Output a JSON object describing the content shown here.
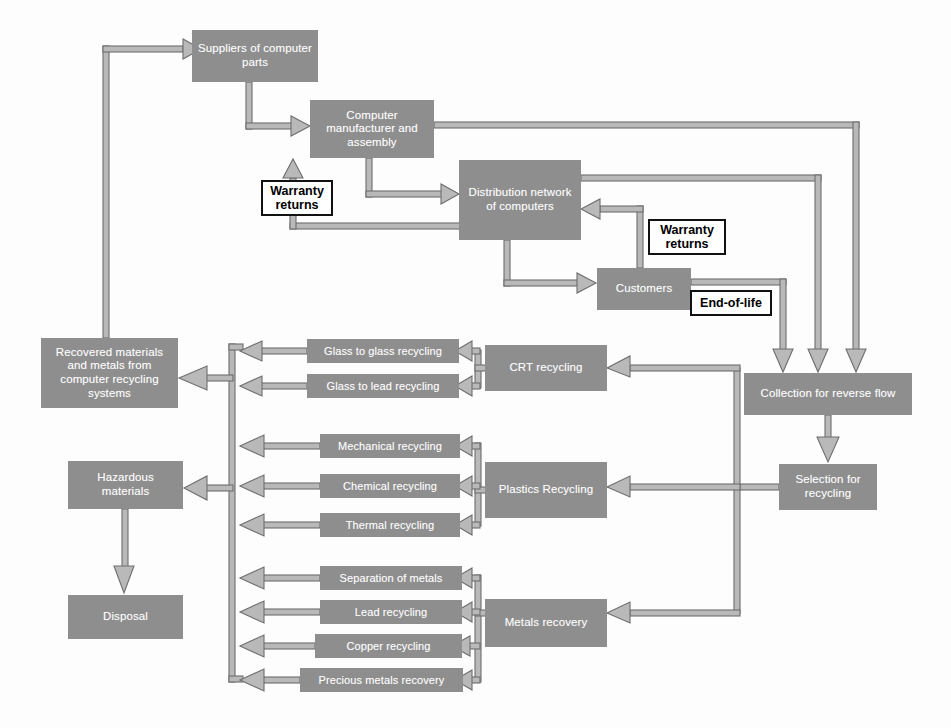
{
  "diagram": {
    "colors": {
      "node_fill": "#8e8e8e",
      "node_text": "#ffffff",
      "connector_fill": "#b3b3b3",
      "connector_stroke": "#6f6f6f",
      "label_border": "#111111",
      "background": "#fdfdfd"
    },
    "nodes": [
      {
        "id": "suppliers",
        "label": "Suppliers of computer parts",
        "x": 192,
        "y": 30,
        "w": 126,
        "h": 52
      },
      {
        "id": "manufacturer",
        "label": "Computer manufacturer and assembly",
        "x": 310,
        "y": 100,
        "w": 124,
        "h": 58
      },
      {
        "id": "distribution",
        "label": "Distribution network of computers",
        "x": 459,
        "y": 160,
        "w": 122,
        "h": 80
      },
      {
        "id": "customers",
        "label": "Customers",
        "x": 597,
        "y": 268,
        "w": 94,
        "h": 42
      },
      {
        "id": "collection",
        "label": "Collection for reverse flow",
        "x": 744,
        "y": 373,
        "w": 168,
        "h": 42
      },
      {
        "id": "selection",
        "label": "Selection for recycling",
        "x": 779,
        "y": 464,
        "w": 98,
        "h": 46
      },
      {
        "id": "crt",
        "label": "CRT recycling",
        "x": 485,
        "y": 345,
        "w": 122,
        "h": 46
      },
      {
        "id": "plastics",
        "label": "Plastics Recycling",
        "x": 485,
        "y": 462,
        "w": 122,
        "h": 56
      },
      {
        "id": "metals",
        "label": "Metals recovery",
        "x": 485,
        "y": 599,
        "w": 122,
        "h": 48
      },
      {
        "id": "glass_glass",
        "label": "Glass to glass recycling",
        "x": 307,
        "y": 339,
        "w": 152,
        "h": 24
      },
      {
        "id": "glass_lead",
        "label": "Glass to lead recycling",
        "x": 307,
        "y": 374,
        "w": 152,
        "h": 24
      },
      {
        "id": "mechanical",
        "label": "Mechanical recycling",
        "x": 320,
        "y": 434,
        "w": 140,
        "h": 24
      },
      {
        "id": "chemical",
        "label": "Chemical recycling",
        "x": 320,
        "y": 474,
        "w": 140,
        "h": 24
      },
      {
        "id": "thermal",
        "label": "Thermal recycling",
        "x": 320,
        "y": 513,
        "w": 140,
        "h": 24
      },
      {
        "id": "separation",
        "label": "Separation of metals",
        "x": 320,
        "y": 566,
        "w": 142,
        "h": 24
      },
      {
        "id": "lead_rec",
        "label": "Lead recycling",
        "x": 320,
        "y": 600,
        "w": 142,
        "h": 24
      },
      {
        "id": "copper_rec",
        "label": "Copper recycling",
        "x": 315,
        "y": 634,
        "w": 147,
        "h": 24
      },
      {
        "id": "precious",
        "label": "Precious metals recovery",
        "x": 300,
        "y": 668,
        "w": 163,
        "h": 24
      },
      {
        "id": "recovered",
        "label": "Recovered materials and metals from computer recycling systems",
        "x": 41,
        "y": 338,
        "w": 137,
        "h": 70
      },
      {
        "id": "hazardous",
        "label": "Hazardous materials",
        "x": 68,
        "y": 461,
        "w": 115,
        "h": 48
      },
      {
        "id": "disposal",
        "label": "Disposal",
        "x": 68,
        "y": 595,
        "w": 115,
        "h": 44
      }
    ],
    "label_boxes": [
      {
        "id": "warranty-returns-manufacturer",
        "label": "Warranty returns",
        "x": 261,
        "y": 180,
        "w": 72,
        "h": 36
      },
      {
        "id": "warranty-returns-distribution",
        "label": "Warranty returns",
        "x": 648,
        "y": 219,
        "w": 78,
        "h": 36
      },
      {
        "id": "end-of-life",
        "label": "End-of-life",
        "x": 690,
        "y": 290,
        "w": 82,
        "h": 26
      }
    ],
    "flows": [
      {
        "from": "recovered",
        "to": "suppliers",
        "label": "recovered materials returned to suppliers"
      },
      {
        "from": "suppliers",
        "to": "manufacturer",
        "label": "parts supply"
      },
      {
        "from": "manufacturer",
        "to": "distribution",
        "label": "finished computers"
      },
      {
        "from": "distribution",
        "to": "customers",
        "label": "distribution to customers"
      },
      {
        "from": "customers",
        "to": "distribution",
        "label": "warranty returns"
      },
      {
        "from": "distribution",
        "to": "manufacturer",
        "label": "warranty returns"
      },
      {
        "from": "customers",
        "to": "collection",
        "label": "end-of-life"
      },
      {
        "from": "distribution",
        "to": "collection",
        "label": "reverse flow"
      },
      {
        "from": "manufacturer",
        "to": "collection",
        "label": "reverse flow"
      },
      {
        "from": "collection",
        "to": "selection",
        "label": "collected units"
      },
      {
        "from": "selection",
        "to": "crt",
        "label": "CRT stream"
      },
      {
        "from": "selection",
        "to": "plastics",
        "label": "plastics stream"
      },
      {
        "from": "selection",
        "to": "metals",
        "label": "metals stream"
      },
      {
        "from": "crt",
        "to": "glass_glass",
        "label": ""
      },
      {
        "from": "crt",
        "to": "glass_lead",
        "label": ""
      },
      {
        "from": "plastics",
        "to": "mechanical",
        "label": ""
      },
      {
        "from": "plastics",
        "to": "chemical",
        "label": ""
      },
      {
        "from": "plastics",
        "to": "thermal",
        "label": ""
      },
      {
        "from": "metals",
        "to": "separation",
        "label": ""
      },
      {
        "from": "metals",
        "to": "lead_rec",
        "label": ""
      },
      {
        "from": "metals",
        "to": "copper_rec",
        "label": ""
      },
      {
        "from": "metals",
        "to": "precious",
        "label": ""
      },
      {
        "from": "collector-bar",
        "to": "recovered",
        "label": "recovered materials"
      },
      {
        "from": "collector-bar",
        "to": "hazardous",
        "label": "hazardous materials"
      },
      {
        "from": "hazardous",
        "to": "disposal",
        "label": "disposal"
      }
    ]
  }
}
